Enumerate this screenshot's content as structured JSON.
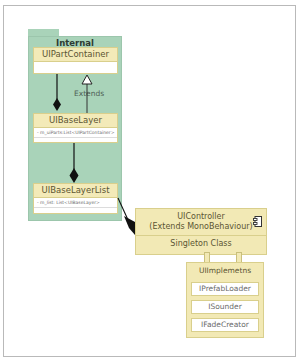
{
  "diagram": {
    "type": "uml-class-diagram",
    "package": {
      "name": "Internal",
      "color": "#a9d3b9"
    },
    "classes": [
      {
        "name": "UIPartContainer",
        "attributes": []
      },
      {
        "name": "UIBaseLayer",
        "attributes": [
          "- m_uiParts:List<UIPartContainer>"
        ]
      },
      {
        "name": "UIBaseLayerList",
        "attributes": [
          "- m_list: List<UIBaseLayer>"
        ]
      }
    ],
    "controller": {
      "name_line1": "UIController",
      "name_line2": "(Extends MonoBehaviour)",
      "stereotype": "Singleton Class",
      "icon": "component-icon"
    },
    "implements": {
      "title": "UIImplemetns",
      "interfaces": [
        "IPrefabLoader",
        "ISounder",
        "IFadeCreator"
      ]
    },
    "relations": [
      {
        "from": "UIBaseLayer",
        "to": "UIPartContainer",
        "kind": "composition"
      },
      {
        "from": "UIBaseLayer",
        "to": "UIPartContainer",
        "kind": "generalization",
        "label": "Extends"
      },
      {
        "from": "UIBaseLayerList",
        "to": "UIBaseLayer",
        "kind": "composition"
      },
      {
        "from": "UIController",
        "to": "UIBaseLayerList",
        "kind": "composition"
      },
      {
        "from": "UIController",
        "to": "UIImplemetns",
        "kind": "ports"
      }
    ],
    "colors": {
      "class_header": "#f3eab8",
      "class_border": "#d9cf8c",
      "package": "#a9d3b9"
    }
  }
}
